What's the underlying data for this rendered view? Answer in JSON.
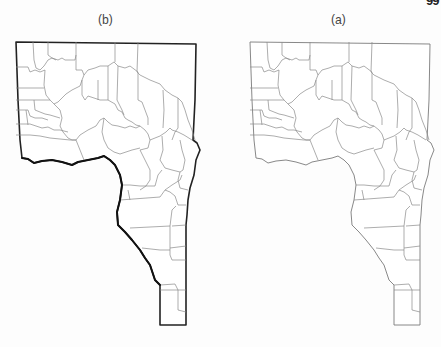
{
  "page": {
    "orientation": "rotated 180 degrees (scanned upside down)",
    "page_number_fragment": "66"
  },
  "figure": {
    "panels": [
      {
        "id": "b",
        "label": "(b)",
        "label_as_rendered": "(q)",
        "position": "left",
        "description": "County map with a thick boundary delineating a region along the south-west edge"
      },
      {
        "id": "a",
        "label": "(a)",
        "label_as_rendered": "(ɐ)",
        "position": "right",
        "description": "County map with thin county boundaries only"
      }
    ],
    "colors": {
      "background": "#fdfdfd",
      "county_lines": "#8a8a8a",
      "thick_boundary": "#111111"
    }
  }
}
